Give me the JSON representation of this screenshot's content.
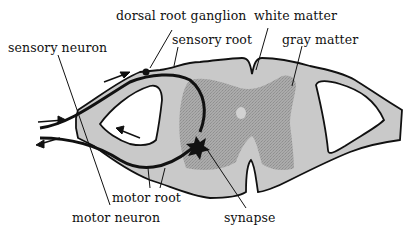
{
  "diagram": {
    "type": "anatomy-cross-section",
    "labels": {
      "dorsal_root_ganglion": "dorsal root ganglion",
      "white_matter": "white matter",
      "sensory_neuron": "sensory neuron",
      "sensory_root": "sensory root",
      "gray_matter": "gray matter",
      "motor_root": "motor root",
      "motor_neuron": "motor neuron",
      "synapse": "synapse"
    },
    "colors": {
      "white_matter": "#c9c9c9",
      "gray_matter": "#a6a6a6",
      "outline": "#111111",
      "background": "#ffffff"
    }
  }
}
